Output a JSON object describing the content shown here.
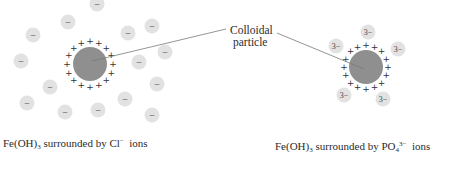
{
  "label": {
    "line1": "Colloidal",
    "line2": "particle"
  },
  "colors": {
    "particle": "#8f8f8f",
    "ion": "#e2e2e2",
    "ion_text": "#444444",
    "charge": "#333333",
    "leader": "#7a7a7a"
  },
  "left_panel": {
    "caption": {
      "prefix": "Fe(OH)",
      "sub": "3",
      "middle": " surrounded by Cl",
      "sup": "−",
      "suffix": "  ions"
    },
    "particle": {
      "cx": 90,
      "cy": 64,
      "r": 17
    },
    "surface_charge": "+",
    "ion_label": "−",
    "ions": [
      [
        97,
        4
      ],
      [
        68,
        22
      ],
      [
        33,
        35
      ],
      [
        21,
        61
      ],
      [
        128,
        33
      ],
      [
        152,
        26
      ],
      [
        165,
        52
      ],
      [
        139,
        62
      ],
      [
        157,
        84
      ],
      [
        50,
        87
      ],
      [
        27,
        103
      ],
      [
        65,
        112
      ],
      [
        98,
        110
      ],
      [
        125,
        99
      ],
      [
        152,
        115
      ]
    ]
  },
  "right_panel": {
    "caption": {
      "prefix": "Fe(OH)",
      "sub": "3",
      "middle": " surrounded by PO",
      "sub2": "4",
      "sup": "3−",
      "suffix": "  ions"
    },
    "particle": {
      "cx": 366,
      "cy": 67,
      "r": 17
    },
    "surface_charge": "+",
    "ion_label": "3−",
    "ions": [
      [
        368,
        32
      ],
      [
        336,
        46
      ],
      [
        398,
        49
      ],
      [
        344,
        95
      ],
      [
        383,
        99
      ]
    ]
  }
}
